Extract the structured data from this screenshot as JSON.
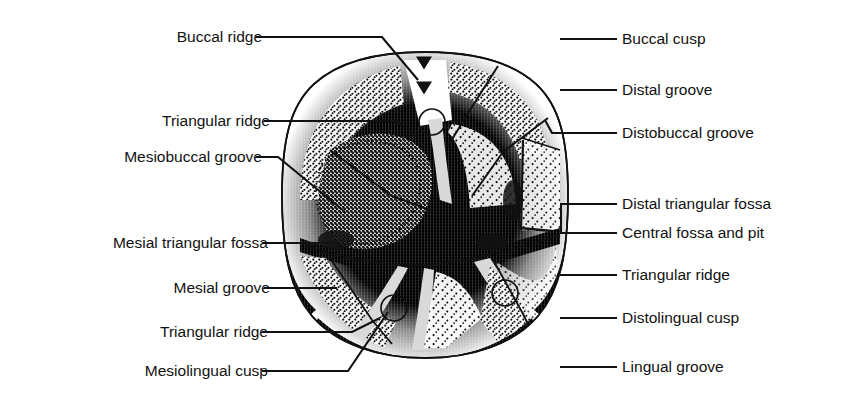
{
  "figure": {
    "colors": {
      "ink": "#111111",
      "background": "#ffffff",
      "groove_fill": "#d9d9d9",
      "stipple": "#000000"
    },
    "labels_left": [
      {
        "id": "buccal-ridge",
        "text": "Buccal ridge",
        "text_x": 256,
        "text_y": 37,
        "leader": "M256,37 L382,37 L418,80"
      },
      {
        "id": "triangular-ridge-upper",
        "text": "Triangular ridge",
        "text_x": 264,
        "text_y": 121,
        "leader": "M264,121 L396,121 L418,137"
      },
      {
        "id": "mesiobuccal-groove",
        "text": "Mesiobuccal groove",
        "text_x": 256,
        "text_y": 157,
        "leader": "M256,157 L278,157 L345,212"
      },
      {
        "id": "mesial-triangular-fossa",
        "text": "Mesial triangular fossa",
        "text_x": 262,
        "text_y": 243,
        "leader": "M262,243 L334,243"
      },
      {
        "id": "mesial-groove",
        "text": "Mesial groove",
        "text_x": 264,
        "text_y": 288,
        "leader": "M264,288 L337,288"
      },
      {
        "id": "triangular-ridge-lower",
        "text": "Triangular ridge",
        "text_x": 262,
        "text_y": 332,
        "leader": "M262,332 L352,332 L380,318"
      },
      {
        "id": "mesiolingual-cusp",
        "text": "Mesiolingual cusp",
        "text_x": 262,
        "text_y": 371,
        "leader": "M262,371 L348,371 L388,312"
      }
    ],
    "labels_right": [
      {
        "id": "buccal-cusp",
        "text": "Buccal cusp",
        "text_x": 622,
        "text_y": 39,
        "leader": "M560,39 L617,39"
      },
      {
        "id": "distal-groove",
        "text": "Distal groove",
        "text_x": 622,
        "text_y": 90,
        "leader": "M560,90 L617,90"
      },
      {
        "id": "distobuccal-groove",
        "text": "Distobuccal groove",
        "text_x": 622,
        "text_y": 133,
        "leader": "M560,133 L617,133"
      },
      {
        "id": "distal-triangular-fossa",
        "text": "Distal triangular fossa",
        "text_x": 622,
        "text_y": 204,
        "leader": "M560,204 L617,204"
      },
      {
        "id": "central-fossa-and-pit",
        "text": "Central fossa and pit",
        "text_x": 622,
        "text_y": 233,
        "leader": "M560,233 L617,233"
      },
      {
        "id": "triangular-ridge-right",
        "text": "Triangular ridge",
        "text_x": 622,
        "text_y": 275,
        "leader": "M560,275 L617,275"
      },
      {
        "id": "distolingual-cusp",
        "text": "Distolingual cusp",
        "text_x": 622,
        "text_y": 318,
        "leader": "M560,318 L617,318"
      },
      {
        "id": "lingual-groove",
        "text": "Lingual groove",
        "text_x": 622,
        "text_y": 367,
        "leader": "M560,367 L617,367"
      }
    ],
    "markers": {
      "cusp_tip_circles": [
        {
          "id": "buccal-cusp-tip",
          "cx": 432,
          "cy": 122,
          "r": 13
        },
        {
          "id": "mesiolingual-cusp-tip",
          "cx": 394,
          "cy": 308,
          "r": 13
        },
        {
          "id": "distolingual-cusp-tip",
          "cx": 505,
          "cy": 293,
          "r": 13
        }
      ],
      "arrowheads": [
        {
          "id": "buccal-ridge-arrow-upper",
          "x": 424,
          "y": 63
        },
        {
          "id": "buccal-ridge-arrow-lower",
          "x": 424,
          "y": 88
        }
      ]
    }
  }
}
